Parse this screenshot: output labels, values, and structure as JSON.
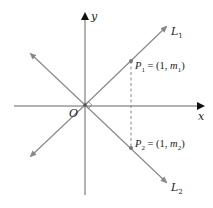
{
  "diagram": {
    "axes": {
      "x_label": "x",
      "y_label": "y",
      "origin_label": "O"
    },
    "lines": [
      {
        "name": "L",
        "sub": "1"
      },
      {
        "name": "L",
        "sub": "2"
      }
    ],
    "points": [
      {
        "name": "P",
        "sub": "1",
        "eq": " = (1, ",
        "m": "m",
        "msub": "1",
        "close": ")"
      },
      {
        "name": "P",
        "sub": "2",
        "eq": " = (1, ",
        "m": "m",
        "msub": "2",
        "close": ")"
      }
    ],
    "colors": {
      "line": "#8a8a8a",
      "axis": "#555555",
      "text": "#222222"
    }
  }
}
